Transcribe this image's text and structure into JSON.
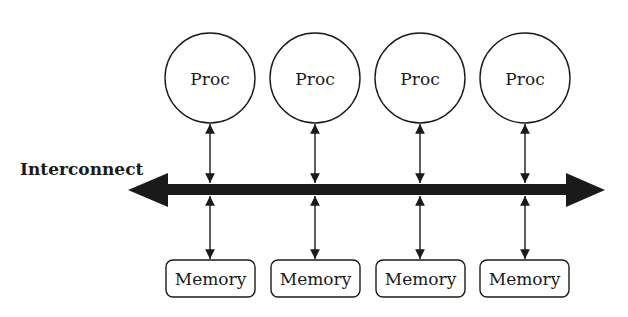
{
  "diagram": {
    "interconnect_label": "Interconnect",
    "processors": [
      {
        "label": "Proc",
        "cx": 210
      },
      {
        "label": "Proc",
        "cx": 315
      },
      {
        "label": "Proc",
        "cx": 420
      },
      {
        "label": "Proc",
        "cx": 525
      }
    ],
    "memories": [
      {
        "label": "Memory",
        "cx": 210
      },
      {
        "label": "Memory",
        "cx": 315
      },
      {
        "label": "Memory",
        "cx": 420
      },
      {
        "label": "Memory",
        "cx": 525
      }
    ],
    "colors": {
      "stroke": "#1a1a1a",
      "background": "#ffffff"
    }
  }
}
